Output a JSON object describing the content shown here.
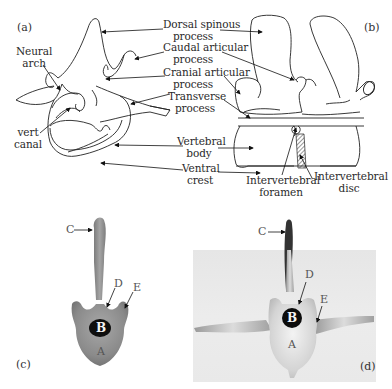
{
  "figure": {
    "panels": {
      "a": {
        "tag": "(a)",
        "labels": {
          "neural_arch": [
            "Neural",
            "arch"
          ],
          "vert_canal": [
            "vert",
            "canal"
          ]
        }
      },
      "b": {
        "tag": "(b)"
      },
      "c": {
        "tag": "(c)",
        "letters": {
          "A": "A",
          "B": "B",
          "C": "C",
          "D": "D",
          "E": "E"
        }
      },
      "d": {
        "tag": "(d)",
        "letters": {
          "A": "A",
          "B": "B",
          "C": "C",
          "D": "D",
          "E": "E"
        }
      }
    },
    "center_labels": {
      "dorsal_spinous_process": [
        "Dorsal spinous",
        "process"
      ],
      "caudal_articular_process": [
        "Caudal articular",
        "process"
      ],
      "cranial_articular_process": [
        "Cranial articular",
        "process"
      ],
      "transverse_process": [
        "Transverse",
        "process"
      ],
      "vertebral_body": [
        "Vertebral",
        "body"
      ],
      "ventral_crest": [
        "Ventral",
        "crest"
      ]
    },
    "bottom_labels": {
      "intervertebral_foramen": [
        "Intervertebral",
        "foramen"
      ],
      "intervertebral_disc": [
        "Intervertebral",
        "disc"
      ]
    }
  }
}
